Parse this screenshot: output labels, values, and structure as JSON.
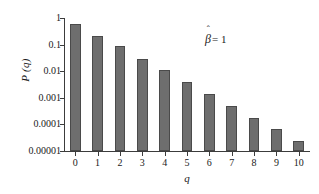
{
  "chart_data": {
    "type": "bar",
    "title": "",
    "subtitle": "",
    "xlabel": "q",
    "ylabel": "P (q)",
    "categories": [
      "0",
      "1",
      "2",
      "3",
      "4",
      "5",
      "6",
      "7",
      "8",
      "9",
      "10"
    ],
    "values": [
      0.6,
      0.22,
      0.085,
      0.03,
      0.011,
      0.0038,
      0.0014,
      0.0005,
      0.00018,
      6.5e-05,
      2.3e-05
    ],
    "yscale": "log",
    "ylim": [
      1e-05,
      1
    ],
    "xlim": [
      -0.5,
      10.5
    ],
    "ytick_labels": [
      "1",
      "0.1",
      "0.01",
      "0.001",
      "0.0001",
      "0.00001"
    ],
    "ytick_values": [
      1,
      0.1,
      0.01,
      0.001,
      0.0001,
      1e-05
    ],
    "xtick_labels": [
      "0",
      "1",
      "2",
      "3",
      "4",
      "5",
      "6",
      "7",
      "8",
      "9",
      "10"
    ],
    "grid": false,
    "legend": false,
    "legend_position": "none",
    "series": [
      {
        "name": "P(q)",
        "values": [
          0.6,
          0.22,
          0.085,
          0.03,
          0.011,
          0.0038,
          0.0014,
          0.0005,
          0.00018,
          6.5e-05,
          2.3e-05
        ]
      }
    ],
    "annotations": [
      {
        "id": "beta-hat",
        "symbol": "β",
        "accent": "ˆ",
        "equals": "= 1",
        "full_text": "β̂ = 1",
        "x_fraction": 0.57,
        "y_fraction": 0.11
      }
    ],
    "colors": {
      "bar_fill": "#6e6e6e",
      "bar_edge": "#4a4a4a",
      "axis": "#3c3c3c",
      "text": "#1a1a1a",
      "background": "#ffffff"
    }
  },
  "figure": {
    "ylabel_text": "P (q)",
    "xlabel_text": "q",
    "annotation_symbol": "β",
    "annotation_hat": "ˆ",
    "annotation_equals": "= 1"
  }
}
